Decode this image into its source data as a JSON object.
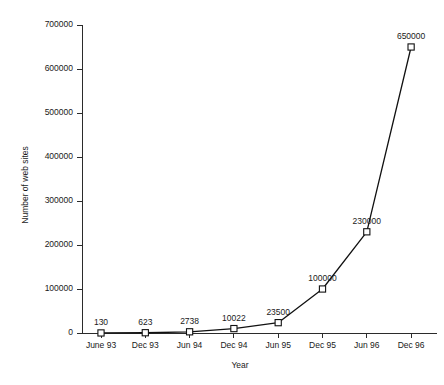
{
  "chart_data": {
    "type": "line",
    "title": "",
    "xlabel": "Year",
    "ylabel": "Number of web sites",
    "categories": [
      "June 93",
      "Dec 93",
      "Jun 94",
      "Dec 94",
      "Jun 95",
      "Dec 95",
      "Jun 96",
      "Dec 96"
    ],
    "values": [
      130,
      623,
      2738,
      10022,
      23500,
      100000,
      230000,
      650000
    ],
    "point_labels": [
      "130",
      "623",
      "2738",
      "10022",
      "23500",
      "100000",
      "230000",
      "650000"
    ],
    "ylim": [
      0,
      700000
    ],
    "xlim_categories": 8,
    "y_ticks": [
      0,
      100000,
      200000,
      300000,
      400000,
      500000,
      600000,
      700000
    ],
    "y_tick_labels": [
      "0",
      "100000",
      "200000",
      "300000",
      "400000",
      "500000",
      "600000",
      "700000"
    ],
    "grid": false,
    "legend": false,
    "legend_position": "none",
    "marker": "open-square",
    "line_color": "#111111",
    "marker_fill": "#ffffff",
    "marker_stroke": "#111111",
    "axis_color": "#2b2b2b",
    "background_color": "#ffffff",
    "series": [
      {
        "name": "Number of web sites",
        "values": [
          130,
          623,
          2738,
          10022,
          23500,
          100000,
          230000,
          650000
        ]
      }
    ]
  }
}
